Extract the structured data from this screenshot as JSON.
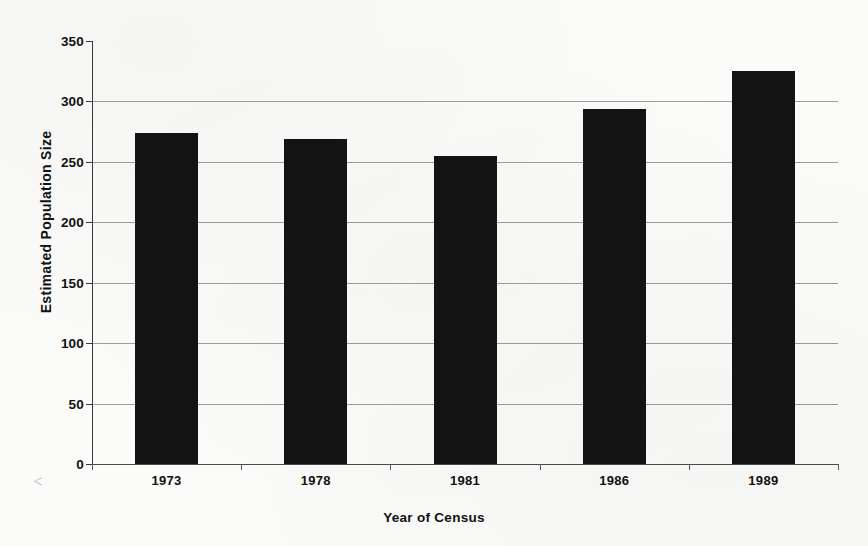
{
  "chart_data": {
    "type": "bar",
    "title": "",
    "subtitle": "",
    "xlabel": "Year of Census",
    "ylabel": "Estimated Population Size",
    "categories": [
      "1973",
      "1978",
      "1981",
      "1986",
      "1989"
    ],
    "values": [
      274,
      269,
      255,
      294,
      325
    ],
    "series": [
      {
        "name": "Estimated Population Size",
        "values": [
          274,
          269,
          255,
          294,
          325
        ],
        "color": "#131313"
      }
    ],
    "ylim": [
      0,
      350
    ],
    "y_ticks": [
      0,
      50,
      100,
      150,
      200,
      250,
      300,
      350
    ],
    "y_tick_labels": [
      "0",
      "50",
      "100",
      "150",
      "200",
      "250",
      "300",
      "350"
    ],
    "grid": true,
    "grid_axis": "y",
    "legend": false,
    "legend_position": "none",
    "bar_color": "#131313",
    "background_color": "#fbfbf9",
    "axis_color": "#3a3a3a",
    "gridline_color": "#8c8c8c",
    "scan_artifact": "<"
  }
}
